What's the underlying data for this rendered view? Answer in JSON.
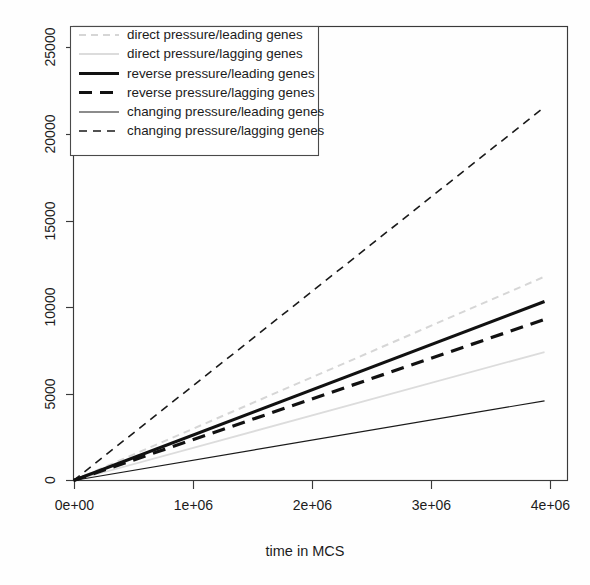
{
  "chart_data": {
    "type": "line",
    "title": "",
    "xlabel": "time in MCS",
    "ylabel": "",
    "xlim": [
      0,
      4300000
    ],
    "ylim": [
      0,
      26500
    ],
    "grid": false,
    "legend_position": "top-left",
    "x_ticks": [
      0,
      1000000,
      2000000,
      3000000,
      4000000
    ],
    "x_tick_labels": [
      "0e+00",
      "1e+06",
      "2e+06",
      "3e+06",
      "4e+06"
    ],
    "y_ticks": [
      0,
      5000,
      10000,
      15000,
      20000,
      25000
    ],
    "y_tick_labels": [
      "0",
      "5000",
      "10000",
      "15000",
      "20000",
      "25000"
    ],
    "x": [
      0,
      4100000
    ],
    "series": [
      {
        "name": "direct pressure/leading genes",
        "values": [
          0,
          11900
        ],
        "color": "#d6d6d6",
        "style": "dashed",
        "width": 2.0,
        "dash": "7,5"
      },
      {
        "name": "direct pressure/lagging genes",
        "values": [
          0,
          7500
        ],
        "color": "#dcdcdc",
        "style": "solid",
        "width": 1.8,
        "dash": ""
      },
      {
        "name": "reverse pressure/leading genes",
        "values": [
          0,
          10450
        ],
        "color": "#111111",
        "style": "solid",
        "width": 3.2,
        "dash": ""
      },
      {
        "name": "reverse pressure/lagging genes",
        "values": [
          0,
          9400
        ],
        "color": "#111111",
        "style": "dashed",
        "width": 3.2,
        "dash": "13,8"
      },
      {
        "name": "changing pressure/leading genes",
        "values": [
          0,
          4650
        ],
        "color": "#1a1a1a",
        "style": "solid",
        "width": 1.2,
        "dash": ""
      },
      {
        "name": "changing pressure/lagging genes",
        "values": [
          0,
          21800
        ],
        "color": "#1a1a1a",
        "style": "dashed",
        "width": 1.6,
        "dash": "8,6"
      }
    ]
  },
  "legend": {
    "items": [
      {
        "label": "direct pressure/leading genes"
      },
      {
        "label": "direct pressure/lagging genes"
      },
      {
        "label": "reverse pressure/leading genes"
      },
      {
        "label": "reverse pressure/lagging genes"
      },
      {
        "label": "changing pressure/leading genes"
      },
      {
        "label": "changing pressure/lagging genes"
      }
    ]
  }
}
